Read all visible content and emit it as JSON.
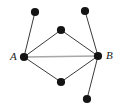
{
  "figure": {
    "type": "undirected-graph-diagram",
    "width": 123,
    "height": 108,
    "background_color": "#ffffff"
  },
  "style": {
    "node_fill": "#141414",
    "node_radius": 4.1,
    "edge_color": "#3b3b3b",
    "edge_width": 1.0,
    "highlight_edge_color": "#a8a8a8",
    "highlight_edge_width": 1.6,
    "label_color": "#1a1a1a"
  },
  "nodes": [
    {
      "id": "top_left",
      "label": "",
      "x": 35,
      "y": 12,
      "name": "node-top-left"
    },
    {
      "id": "top_mid",
      "label": "",
      "x": 61,
      "y": 30,
      "name": "node-top-middle"
    },
    {
      "id": "top_right",
      "label": "",
      "x": 85,
      "y": 11,
      "name": "node-top-right"
    },
    {
      "id": "A",
      "label": "A",
      "x": 24,
      "y": 57,
      "name": "node-a"
    },
    {
      "id": "B",
      "label": "B",
      "x": 98,
      "y": 56,
      "name": "node-b"
    },
    {
      "id": "bottom_mid",
      "label": "",
      "x": 61,
      "y": 82,
      "name": "node-bottom-middle"
    },
    {
      "id": "bottom_right",
      "label": "",
      "x": 87,
      "y": 99,
      "name": "node-bottom-right"
    }
  ],
  "edges": [
    {
      "from": "A",
      "to": "top_left",
      "style": "plain",
      "name": "edge-a-top-left"
    },
    {
      "from": "A",
      "to": "top_mid",
      "style": "plain",
      "name": "edge-a-top-middle"
    },
    {
      "from": "A",
      "to": "bottom_mid",
      "style": "plain",
      "name": "edge-a-bottom-middle"
    },
    {
      "from": "A",
      "to": "B",
      "style": "highlight",
      "name": "edge-a-b"
    },
    {
      "from": "B",
      "to": "top_mid",
      "style": "plain",
      "name": "edge-b-top-middle"
    },
    {
      "from": "B",
      "to": "top_right",
      "style": "plain",
      "name": "edge-b-top-right"
    },
    {
      "from": "B",
      "to": "bottom_mid",
      "style": "plain",
      "name": "edge-b-bottom-middle"
    },
    {
      "from": "B",
      "to": "bottom_right",
      "style": "plain",
      "name": "edge-b-bottom-right"
    }
  ],
  "labels": [
    {
      "text": "A",
      "x": 10,
      "y": 51,
      "name": "label-a"
    },
    {
      "text": "B",
      "x": 106,
      "y": 50,
      "name": "label-b"
    }
  ]
}
